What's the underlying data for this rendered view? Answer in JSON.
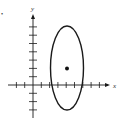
{
  "diagram": {
    "type": "ellipse-on-axes",
    "axes": {
      "x_label": "x",
      "y_label": "y"
    },
    "ellipse": {
      "center": [
        4,
        2
      ],
      "semi_axis_x": 2,
      "semi_axis_y": 5
    },
    "center_point": [
      4,
      2
    ],
    "ticks": {
      "x_min": -3,
      "x_max": 8,
      "y_min": -4,
      "y_max": 7
    },
    "colors": {
      "stroke": "#1a1a1a",
      "background": "#ffffff"
    },
    "marker": "•"
  }
}
